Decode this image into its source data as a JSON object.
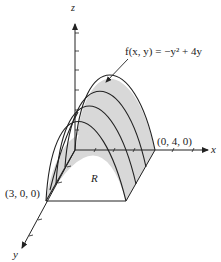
{
  "figure": {
    "axes": {
      "x_label": "x",
      "y_label": "y",
      "z_label": "z"
    },
    "function_label": "f(x, y) = −y² + 4y",
    "region_label": "R",
    "points": [
      {
        "label": "(0, 4, 0)"
      },
      {
        "label": "(3, 0, 0)"
      }
    ],
    "colors": {
      "surface_fill": "#d8d8d8",
      "line": "#222222"
    }
  }
}
